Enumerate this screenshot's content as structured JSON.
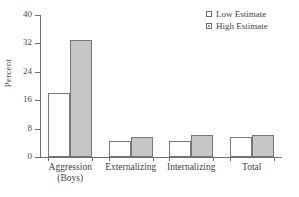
{
  "chart_data": {
    "type": "bar",
    "title": "",
    "xlabel": "",
    "ylabel": "Percent",
    "ylim": [
      0,
      40
    ],
    "yticks": [
      0,
      8,
      16,
      24,
      32,
      40
    ],
    "grid": false,
    "legend_position": "top-right",
    "categories": [
      "Aggression (Boys)",
      "Externalizing",
      "Internalizing",
      "Total"
    ],
    "category_lines": [
      [
        "Aggression",
        "(Boys)"
      ],
      [
        "Externalizing"
      ],
      [
        "Internalizing"
      ],
      [
        "Total"
      ]
    ],
    "series": [
      {
        "name": "Low Estimate",
        "color": "#ffffff",
        "values": [
          18,
          4.5,
          4.5,
          5.5
        ]
      },
      {
        "name": "High Estimate",
        "color": "#c6c6c6",
        "values": [
          33,
          5.5,
          6.2,
          6.3
        ]
      }
    ]
  },
  "axis": {
    "ylabel": "Percent",
    "ytick_labels": [
      "0",
      "8",
      "16",
      "24",
      "32",
      "40"
    ]
  },
  "legend": {
    "items": [
      {
        "label": "Low Estimate",
        "swatch": "legend-swatch-low"
      },
      {
        "label": "High Estimate",
        "swatch": "legend-swatch-high"
      }
    ]
  }
}
